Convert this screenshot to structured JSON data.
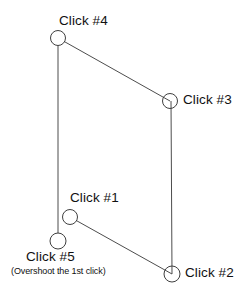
{
  "diagram": {
    "stroke_color": "#4d4d4d",
    "node_stroke_color": "#3f3f3f",
    "background_color": "#ffffff",
    "nodes": [
      {
        "id": "click1",
        "label": "Click #1",
        "cx": 70,
        "cy": 217,
        "r": 8
      },
      {
        "id": "click2",
        "label": "Click #2",
        "cx": 172,
        "cy": 274,
        "r": 8
      },
      {
        "id": "click3",
        "label": "Click #3",
        "cx": 170,
        "cy": 101,
        "r": 8
      },
      {
        "id": "click4",
        "label": "Click #4",
        "cx": 58,
        "cy": 38,
        "r": 8
      },
      {
        "id": "click5",
        "label": "Click #5",
        "cx": 58,
        "cy": 241,
        "r": 8
      }
    ],
    "note": "(Overshoot the 1st click)",
    "segments": [
      {
        "from": "click1",
        "to": "click2"
      },
      {
        "from": "click2",
        "to": "click3"
      },
      {
        "from": "click3",
        "to": "click4"
      },
      {
        "from": "click4",
        "to": "click5"
      }
    ]
  }
}
